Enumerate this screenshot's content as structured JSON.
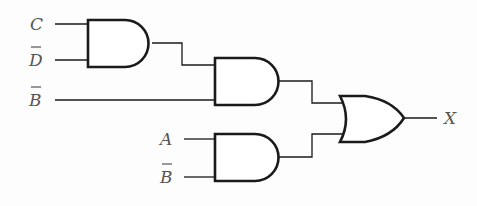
{
  "diagram": {
    "type": "logic-circuit",
    "inputs": [
      {
        "id": "C",
        "label": "C",
        "overbar": false
      },
      {
        "id": "Dbar",
        "label": "D",
        "overbar": true
      },
      {
        "id": "Bbar1",
        "label": "B",
        "overbar": true
      },
      {
        "id": "A",
        "label": "A",
        "overbar": false
      },
      {
        "id": "Bbar2",
        "label": "B",
        "overbar": true
      }
    ],
    "gates": [
      {
        "id": "and1",
        "type": "AND",
        "inputs": [
          "C",
          "D̄"
        ]
      },
      {
        "id": "and2",
        "type": "AND",
        "inputs": [
          "and1",
          "B̄"
        ]
      },
      {
        "id": "and3",
        "type": "AND",
        "inputs": [
          "A",
          "B̄"
        ]
      },
      {
        "id": "or1",
        "type": "OR",
        "inputs": [
          "and2",
          "and3"
        ]
      }
    ],
    "output": {
      "label": "X"
    },
    "colors": {
      "stroke": "#1a1a1a",
      "label": "#555555"
    }
  }
}
